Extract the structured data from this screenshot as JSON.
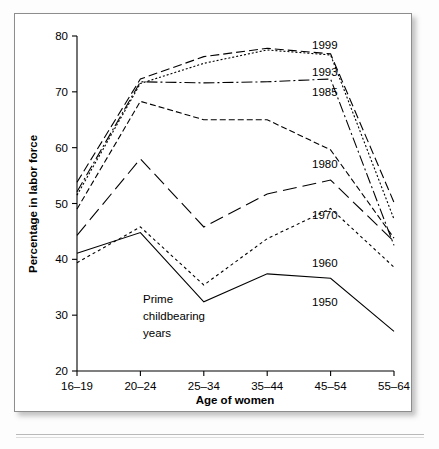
{
  "chart_data": {
    "type": "line",
    "title": "",
    "xlabel": "Age of women",
    "ylabel": "Percentage in labor force",
    "categories": [
      "16–19",
      "20–24",
      "25–34",
      "35–44",
      "45–54",
      "55–64"
    ],
    "ylim": [
      20,
      80
    ],
    "yticks": [
      20,
      30,
      40,
      50,
      60,
      70,
      80
    ],
    "ytick_labels": [
      "20",
      "30",
      "40",
      "50",
      "60",
      "70",
      "80"
    ],
    "grid": false,
    "legend_position": "inline-right-of-lines",
    "annotations": [
      {
        "text_lines": [
          "Prime",
          "childbearing",
          "years"
        ],
        "near_category": "25–34"
      }
    ],
    "series": [
      {
        "name": "1999",
        "label": "1999",
        "dash": "9,4",
        "values": [
          53.8,
          72.3,
          76.3,
          77.8,
          76.8,
          50.2
        ]
      },
      {
        "name": "1993",
        "label": "1993",
        "dash": "2,2",
        "values": [
          51.5,
          71.5,
          75.1,
          77.5,
          76.6,
          47.2
        ]
      },
      {
        "name": "1985",
        "label": "1985",
        "dash": "11,3,2,3",
        "values": [
          52.1,
          71.8,
          71.6,
          71.8,
          72.3,
          42.5
        ]
      },
      {
        "name": "1980",
        "label": "1980",
        "dash": "6,3",
        "values": [
          49.0,
          68.3,
          65.0,
          65.0,
          59.6,
          43.8
        ]
      },
      {
        "name": "1970",
        "label": "1970",
        "dash": "14,6",
        "values": [
          44.3,
          58.0,
          45.8,
          51.7,
          54.2,
          43.2
        ]
      },
      {
        "name": "1960",
        "label": "1960",
        "dash": "3,3",
        "values": [
          39.4,
          45.8,
          35.4,
          43.7,
          49.1,
          38.6
        ]
      },
      {
        "name": "1950",
        "label": "1950",
        "dash": "none",
        "values": [
          41.1,
          44.8,
          32.4,
          37.4,
          36.6,
          27.1
        ]
      }
    ],
    "series_labels_placement": [
      {
        "name": "1999",
        "x": 297,
        "y": 35
      },
      {
        "name": "1993",
        "x": 297,
        "y": 62
      },
      {
        "name": "1985",
        "x": 297,
        "y": 82
      },
      {
        "name": "1980",
        "x": 297,
        "y": 154
      },
      {
        "name": "1970",
        "x": 297,
        "y": 205
      },
      {
        "name": "1960",
        "x": 297,
        "y": 253
      },
      {
        "name": "1950",
        "x": 297,
        "y": 292
      }
    ],
    "colors": {
      "line": "#000000",
      "axis": "#000000",
      "text": "#000000",
      "plot_background": "#ffffff",
      "card_border": "#8d8d8d"
    }
  }
}
